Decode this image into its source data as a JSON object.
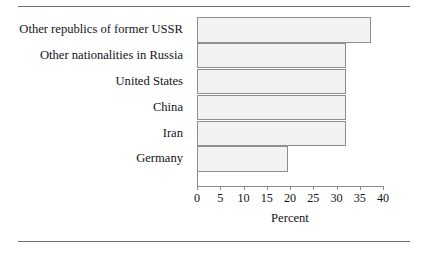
{
  "figure": {
    "background_color": "#ffffff",
    "rule_color": "#6e6e6e",
    "bar_fill_color": "#f2f2f2",
    "bar_border_color": "#8e8e8e",
    "axis_color": "#8a8a8a"
  },
  "chart_data": {
    "type": "bar",
    "orientation": "horizontal",
    "title": "",
    "subtitle": "",
    "xlabel": "Percent",
    "ylabel": "",
    "xlim": [
      0,
      40
    ],
    "ylim": null,
    "grid": false,
    "legend": null,
    "legend_position": "none",
    "xticks": [
      0,
      5,
      10,
      15,
      20,
      25,
      30,
      35,
      40
    ],
    "xtick_labels": [
      "0",
      "5",
      "10",
      "15",
      "20",
      "25",
      "30",
      "35",
      "40"
    ],
    "categories": [
      "Other republics of former USSR",
      "Other nationalities in Russia",
      "United States",
      "China",
      "Iran",
      "Germany"
    ],
    "values": [
      37.5,
      32.0,
      32.0,
      32.0,
      32.0,
      19.5
    ],
    "annotations": []
  }
}
